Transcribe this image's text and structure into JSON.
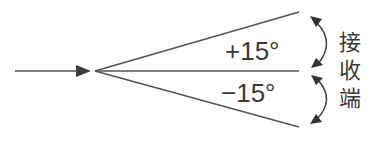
{
  "diagram": {
    "type": "receiver-angle-diagram",
    "colors": {
      "stroke": "#555555",
      "text": "#3a3a3a",
      "background": "#ffffff"
    },
    "labels": {
      "upper_angle": "+15°",
      "lower_angle": "−15°",
      "receiver_char_1": "接",
      "receiver_char_2": "收",
      "receiver_char_3": "端"
    },
    "rays": [
      {
        "name": "upper-ray",
        "angle_deg": 15
      },
      {
        "name": "center-ray",
        "angle_deg": 0
      },
      {
        "name": "lower-ray",
        "angle_deg": -15
      }
    ]
  }
}
